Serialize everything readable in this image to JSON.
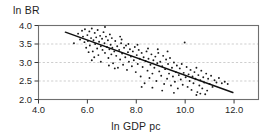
{
  "chart_data": {
    "type": "scatter",
    "title": "",
    "xlabel": "ln GDP pc",
    "ylabel": "ln BR",
    "xlim": [
      4.0,
      13.0
    ],
    "ylim": [
      2.0,
      4.0
    ],
    "xticks": [
      "4.0",
      "6.0",
      "8.0",
      "10.0",
      "12.0"
    ],
    "xtick_values": [
      4.0,
      6.0,
      8.0,
      10.0,
      12.0
    ],
    "yticks": [
      "2.0",
      "2.5",
      "3.0",
      "3.5",
      "4.0"
    ],
    "ytick_values": [
      2.0,
      2.5,
      3.0,
      3.5,
      4.0
    ],
    "grid": "horizontal-dashed",
    "grid_values": [
      2.5,
      3.0,
      3.5
    ],
    "legend": "none",
    "marker_color": "#1a1a1a",
    "line_color": "#111111",
    "frame_color": "#6f6f6f",
    "grid_color": "#b9b9b9",
    "background": "#ffffff",
    "series": [
      {
        "name": "countries",
        "type": "scatter",
        "points": [
          [
            5.45,
            3.52
          ],
          [
            5.62,
            3.78
          ],
          [
            5.7,
            3.62
          ],
          [
            5.78,
            3.86
          ],
          [
            5.82,
            3.7
          ],
          [
            5.88,
            3.55
          ],
          [
            5.9,
            3.9
          ],
          [
            5.95,
            3.4
          ],
          [
            6.0,
            3.74
          ],
          [
            6.02,
            3.58
          ],
          [
            6.08,
            3.84
          ],
          [
            6.1,
            3.46
          ],
          [
            6.15,
            3.66
          ],
          [
            6.18,
            3.92
          ],
          [
            6.22,
            3.3
          ],
          [
            6.25,
            3.6
          ],
          [
            6.3,
            3.8
          ],
          [
            6.32,
            3.5
          ],
          [
            6.36,
            3.68
          ],
          [
            6.4,
            3.38
          ],
          [
            6.42,
            3.88
          ],
          [
            6.45,
            3.2
          ],
          [
            6.48,
            3.56
          ],
          [
            6.52,
            3.72
          ],
          [
            6.55,
            3.44
          ],
          [
            6.6,
            3.64
          ],
          [
            6.62,
            3.34
          ],
          [
            6.66,
            3.82
          ],
          [
            6.7,
            3.52
          ],
          [
            6.72,
            3.26
          ],
          [
            6.76,
            3.7
          ],
          [
            6.8,
            3.42
          ],
          [
            6.84,
            3.6
          ],
          [
            6.86,
            3.12
          ],
          [
            6.9,
            3.36
          ],
          [
            6.92,
            3.76
          ],
          [
            6.95,
            3.48
          ],
          [
            6.98,
            3.22
          ],
          [
            7.0,
            3.66
          ],
          [
            7.02,
            3.4
          ],
          [
            7.05,
            2.98
          ],
          [
            7.1,
            3.3
          ],
          [
            7.14,
            3.58
          ],
          [
            7.18,
            3.18
          ],
          [
            7.22,
            3.44
          ],
          [
            7.25,
            2.86
          ],
          [
            7.3,
            3.34
          ],
          [
            7.34,
            3.08
          ],
          [
            7.38,
            3.52
          ],
          [
            7.42,
            3.24
          ],
          [
            7.46,
            2.94
          ],
          [
            7.5,
            3.4
          ],
          [
            7.55,
            3.14
          ],
          [
            7.58,
            3.46
          ],
          [
            7.62,
            2.8
          ],
          [
            7.66,
            3.28
          ],
          [
            7.7,
            3.02
          ],
          [
            7.74,
            3.36
          ],
          [
            7.78,
            3.16
          ],
          [
            7.82,
            2.9
          ],
          [
            7.86,
            3.3
          ],
          [
            7.9,
            3.06
          ],
          [
            7.94,
            3.42
          ],
          [
            7.98,
            2.74
          ],
          [
            8.02,
            3.2
          ],
          [
            8.06,
            2.96
          ],
          [
            8.1,
            3.34
          ],
          [
            8.14,
            3.1
          ],
          [
            8.18,
            2.62
          ],
          [
            8.22,
            3.26
          ],
          [
            8.26,
            2.88
          ],
          [
            8.3,
            3.14
          ],
          [
            8.34,
            2.44
          ],
          [
            8.38,
            3.04
          ],
          [
            8.42,
            3.3
          ],
          [
            8.46,
            2.78
          ],
          [
            8.5,
            3.1
          ],
          [
            8.54,
            2.58
          ],
          [
            8.58,
            2.94
          ],
          [
            8.62,
            3.22
          ],
          [
            8.66,
            2.7
          ],
          [
            8.7,
            3.06
          ],
          [
            8.74,
            2.86
          ],
          [
            8.78,
            3.16
          ],
          [
            8.82,
            2.5
          ],
          [
            8.86,
            2.98
          ],
          [
            8.9,
            3.26
          ],
          [
            8.94,
            2.76
          ],
          [
            8.98,
            3.02
          ],
          [
            9.02,
            2.64
          ],
          [
            9.06,
            2.9
          ],
          [
            9.1,
            3.18
          ],
          [
            9.14,
            2.42
          ],
          [
            9.18,
            2.82
          ],
          [
            9.22,
            3.08
          ],
          [
            9.26,
            2.56
          ],
          [
            9.3,
            2.96
          ],
          [
            9.34,
            2.7
          ],
          [
            9.38,
            3.12
          ],
          [
            9.42,
            2.38
          ],
          [
            9.46,
            2.86
          ],
          [
            9.5,
            2.62
          ],
          [
            9.54,
            3.0
          ],
          [
            9.58,
            2.48
          ],
          [
            9.62,
            2.74
          ],
          [
            9.66,
            2.92
          ],
          [
            9.7,
            2.3
          ],
          [
            9.74,
            2.66
          ],
          [
            9.78,
            2.84
          ],
          [
            9.82,
            2.54
          ],
          [
            9.86,
            2.96
          ],
          [
            9.9,
            2.4
          ],
          [
            9.94,
            2.72
          ],
          [
            9.98,
            3.54
          ],
          [
            10.02,
            2.6
          ],
          [
            10.06,
            2.88
          ],
          [
            10.1,
            2.34
          ],
          [
            10.14,
            2.68
          ],
          [
            10.18,
            2.5
          ],
          [
            10.22,
            2.8
          ],
          [
            10.26,
            2.26
          ],
          [
            10.3,
            2.62
          ],
          [
            10.34,
            2.44
          ],
          [
            10.38,
            2.74
          ],
          [
            10.42,
            2.56
          ],
          [
            10.46,
            2.86
          ],
          [
            10.5,
            2.2
          ],
          [
            10.54,
            2.66
          ],
          [
            10.58,
            2.38
          ],
          [
            10.62,
            2.52
          ],
          [
            10.66,
            2.78
          ],
          [
            10.7,
            2.3
          ],
          [
            10.74,
            2.6
          ],
          [
            10.78,
            2.46
          ],
          [
            10.82,
            2.14
          ],
          [
            10.86,
            2.7
          ],
          [
            10.9,
            2.24
          ],
          [
            10.94,
            2.56
          ],
          [
            11.0,
            2.42
          ],
          [
            11.06,
            2.64
          ],
          [
            11.12,
            2.34
          ],
          [
            11.2,
            2.52
          ],
          [
            11.28,
            2.46
          ],
          [
            11.38,
            2.58
          ],
          [
            11.5,
            2.44
          ],
          [
            11.62,
            2.48
          ],
          [
            11.74,
            2.42
          ],
          [
            6.05,
            3.28
          ],
          [
            6.28,
            3.14
          ],
          [
            6.55,
            3.02
          ],
          [
            6.88,
            2.92
          ],
          [
            7.12,
            2.84
          ],
          [
            7.4,
            3.62
          ],
          [
            7.68,
            3.5
          ],
          [
            8.05,
            3.48
          ],
          [
            8.48,
            3.38
          ],
          [
            8.88,
            3.36
          ],
          [
            9.28,
            3.3
          ],
          [
            7.34,
            3.7
          ],
          [
            6.72,
            3.96
          ],
          [
            6.18,
            3.06
          ],
          [
            8.22,
            2.34
          ],
          [
            8.66,
            2.32
          ],
          [
            9.06,
            2.24
          ],
          [
            10.46,
            2.12
          ],
          [
            10.62,
            2.16
          ],
          [
            9.54,
            2.18
          ]
        ]
      },
      {
        "name": "regression-line",
        "type": "line",
        "x0": 5.1,
        "y0": 3.82,
        "x1": 11.95,
        "y1": 2.19
      }
    ]
  },
  "axes": {
    "ylabel_text": "ln BR",
    "xlabel_text": "ln GDP pc"
  }
}
